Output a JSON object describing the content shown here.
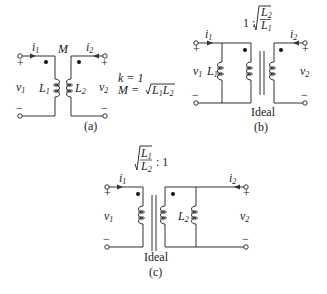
{
  "diagrams": {
    "a": {
      "caption": "(a)",
      "mutual_label": "M",
      "current_left": "i",
      "current_left_sub": "1",
      "current_right": "i",
      "current_right_sub": "2",
      "voltage_left": "v",
      "voltage_left_sub": "1",
      "voltage_right": "v",
      "voltage_right_sub": "2",
      "plus": "+",
      "minus": "−",
      "inductor_left": "L",
      "inductor_left_sub": "1",
      "inductor_right": "L",
      "inductor_right_sub": "2",
      "eq_k": "k = 1",
      "eq_m_lhs": "M = ",
      "eq_m_rhs_a": "L",
      "eq_m_rhs_a_sub": "1",
      "eq_m_rhs_b": "L",
      "eq_m_rhs_b_sub": "2"
    },
    "b": {
      "caption": "(b)",
      "ideal_label": "Ideal",
      "ratio_prefix": "1 :",
      "ratio_num": "L",
      "ratio_num_sub": "2",
      "ratio_den": "L",
      "ratio_den_sub": "1",
      "current_left": "i",
      "current_left_sub": "1",
      "current_right": "i",
      "current_right_sub": "2",
      "voltage_left": "v",
      "voltage_left_sub": "1",
      "voltage_right": "v",
      "voltage_right_sub": "2",
      "plus": "+",
      "minus": "−",
      "shunt_inductor": "L",
      "shunt_inductor_sub": "1"
    },
    "c": {
      "caption": "(c)",
      "ideal_label": "Ideal",
      "ratio_suffix": ": 1",
      "ratio_num": "L",
      "ratio_num_sub": "1",
      "ratio_den": "L",
      "ratio_den_sub": "2",
      "current_left": "i",
      "current_left_sub": "1",
      "current_right": "i",
      "current_right_sub": "2",
      "voltage_left": "v",
      "voltage_left_sub": "1",
      "voltage_right": "v",
      "voltage_right_sub": "2",
      "plus": "+",
      "minus": "−",
      "shunt_inductor": "L",
      "shunt_inductor_sub": "2"
    }
  }
}
